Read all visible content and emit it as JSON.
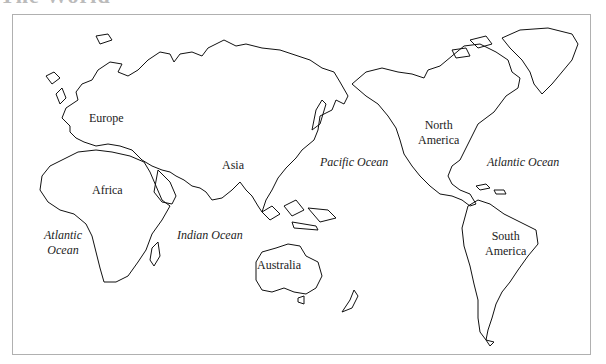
{
  "title": "The World",
  "map": {
    "frame_color": "#b0b0b0",
    "continents": [
      {
        "id": "europe",
        "label": "Europe"
      },
      {
        "id": "africa",
        "label": "Africa"
      },
      {
        "id": "asia",
        "label": "Asia"
      },
      {
        "id": "australia",
        "label": "Australia"
      },
      {
        "id": "north-america",
        "label_line1": "North",
        "label_line2": "America"
      },
      {
        "id": "south-america",
        "label_line1": "South",
        "label_line2": "America"
      }
    ],
    "oceans": [
      {
        "id": "pacific",
        "label": "Pacific Ocean"
      },
      {
        "id": "atlantic-east",
        "label": "Atlantic Ocean"
      },
      {
        "id": "atlantic-west",
        "label_line1": "Atlantic",
        "label_line2": "Ocean"
      },
      {
        "id": "indian",
        "label": "Indian Ocean"
      }
    ]
  }
}
